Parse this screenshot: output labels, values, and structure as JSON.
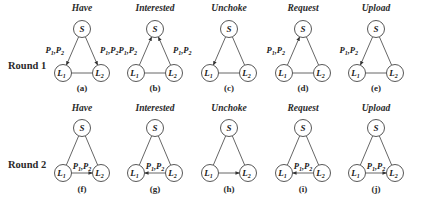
{
  "rows": [
    {
      "label": "Round 1",
      "panels": [
        {
          "id": "a",
          "caption": "(a)",
          "title": "Have",
          "edges": [
            {
              "from": "S",
              "to": "L1",
              "label": "P1,P2"
            },
            {
              "from": "S",
              "to": "L2",
              "label": "P1,P2"
            }
          ]
        },
        {
          "id": "b",
          "caption": "(b)",
          "title": "Interested",
          "edges": [
            {
              "from": "L1",
              "to": "S",
              "label": "P1,P2"
            },
            {
              "from": "L2",
              "to": "S",
              "label": "P1,P2"
            }
          ]
        },
        {
          "id": "c",
          "caption": "(c)",
          "title": "Unchoke",
          "edges": [
            {
              "from": "S",
              "to": "L1",
              "label": ""
            }
          ]
        },
        {
          "id": "d",
          "caption": "(d)",
          "title": "Request",
          "edges": [
            {
              "from": "L1",
              "to": "S",
              "label": "P1,P2"
            }
          ]
        },
        {
          "id": "e",
          "caption": "(e)",
          "title": "Upload",
          "edges": [
            {
              "from": "S",
              "to": "L1",
              "label": "P1,P2"
            }
          ]
        }
      ]
    },
    {
      "label": "Round 2",
      "panels": [
        {
          "id": "f",
          "caption": "(f)",
          "title": "Have",
          "edges": [
            {
              "from": "L1",
              "to": "L2",
              "label": "P1,P2"
            }
          ]
        },
        {
          "id": "g",
          "caption": "(g)",
          "title": "Interested",
          "edges": [
            {
              "from": "L2",
              "to": "L1",
              "label": "P1,P2"
            }
          ]
        },
        {
          "id": "h",
          "caption": "(h)",
          "title": "Unchoke",
          "edges": [
            {
              "from": "L1",
              "to": "L2",
              "label": ""
            }
          ]
        },
        {
          "id": "i",
          "caption": "(i)",
          "title": "Request",
          "edges": [
            {
              "from": "L2",
              "to": "L1",
              "label": "P1,P2"
            }
          ]
        },
        {
          "id": "j",
          "caption": "(j)",
          "title": "Upload",
          "edges": [
            {
              "from": "L1",
              "to": "L2",
              "label": "P1,P2"
            }
          ]
        }
      ]
    }
  ],
  "nodes": {
    "S": "S",
    "L1": "L",
    "L1_sub": "1",
    "L2": "L",
    "L2_sub": "2"
  },
  "piece_label": {
    "p": "P",
    "sub1": "1",
    "sep": ",",
    "sub2": "2"
  }
}
